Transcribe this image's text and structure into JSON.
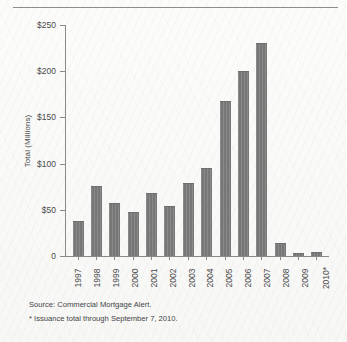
{
  "chart_data": {
    "type": "bar",
    "title": "",
    "subtitle": "",
    "xlabel": "",
    "ylabel": "Total (Millions)",
    "ylim": [
      0,
      250
    ],
    "ytick_labels": [
      "$250",
      "$200",
      "$150",
      "$100",
      "$50",
      "0"
    ],
    "ytick_values": [
      250,
      200,
      150,
      100,
      50,
      0
    ],
    "grid": false,
    "legend": null,
    "bar_color": "#7d7d7d",
    "categories": [
      "1997",
      "1998",
      "1999",
      "2000",
      "2001",
      "2002",
      "2003",
      "2004",
      "2005",
      "2006",
      "2007",
      "2008",
      "2009",
      "2010*"
    ],
    "values": [
      38,
      76,
      57,
      48,
      68,
      54,
      79,
      95,
      168,
      200,
      231,
      14,
      3,
      4
    ],
    "annotations": [
      "Source: Commercial Mortgage Alert.",
      "* Issuance total through September 7, 2010."
    ]
  },
  "figure": {
    "source_note": "Source: Commercial Mortgage Alert.",
    "footnote": "* Issuance total through September 7, 2010."
  }
}
